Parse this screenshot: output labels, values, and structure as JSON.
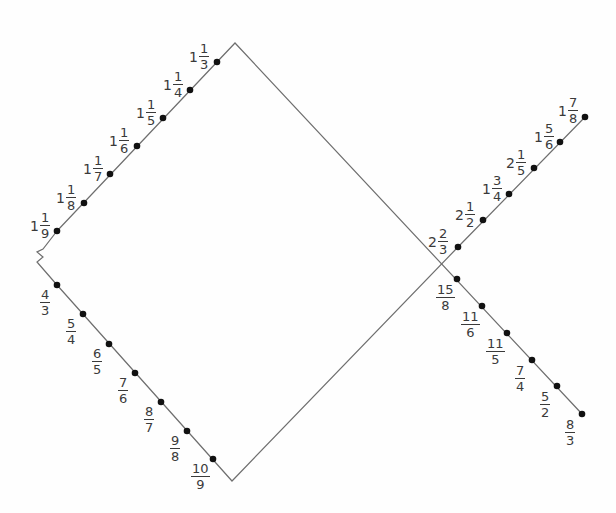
{
  "diagram": {
    "type": "dot-to-dot",
    "shape": "fish",
    "line_color": "#6e6e6e",
    "dot_color": "#111111",
    "label_color": "#3a3a3a",
    "outline_points": [
      [
        57,
        231
      ],
      [
        43,
        249
      ],
      [
        37,
        252
      ],
      [
        43,
        257
      ],
      [
        37,
        262
      ],
      [
        57,
        285
      ],
      [
        232,
        481
      ],
      [
        458,
        247
      ],
      [
        585,
        117
      ]
    ],
    "outline_points_2": [
      [
        57,
        231
      ],
      [
        235,
        43
      ],
      [
        582,
        414
      ]
    ],
    "dots": [
      {
        "id": "d1",
        "x": 217,
        "y": 62,
        "whole": "1",
        "num": "1",
        "den": "3",
        "lx": 189,
        "ly": 42
      },
      {
        "id": "d2",
        "x": 190,
        "y": 90,
        "whole": "1",
        "num": "1",
        "den": "4",
        "lx": 163,
        "ly": 70
      },
      {
        "id": "d3",
        "x": 163,
        "y": 118,
        "whole": "1",
        "num": "1",
        "den": "5",
        "lx": 136,
        "ly": 98
      },
      {
        "id": "d4",
        "x": 137,
        "y": 146,
        "whole": "1",
        "num": "1",
        "den": "6",
        "lx": 109,
        "ly": 126
      },
      {
        "id": "d5",
        "x": 110,
        "y": 174,
        "whole": "1",
        "num": "1",
        "den": "7",
        "lx": 83,
        "ly": 154
      },
      {
        "id": "d6",
        "x": 84,
        "y": 203,
        "whole": "1",
        "num": "1",
        "den": "8",
        "lx": 56,
        "ly": 183
      },
      {
        "id": "d7",
        "x": 57,
        "y": 231,
        "whole": "1",
        "num": "1",
        "den": "9",
        "lx": 30,
        "ly": 211
      },
      {
        "id": "d8",
        "x": 57,
        "y": 285,
        "whole": "",
        "num": "4",
        "den": "3",
        "lx": 40,
        "ly": 288
      },
      {
        "id": "d9",
        "x": 83,
        "y": 314,
        "whole": "",
        "num": "5",
        "den": "4",
        "lx": 66,
        "ly": 317
      },
      {
        "id": "d10",
        "x": 109,
        "y": 344,
        "whole": "",
        "num": "6",
        "den": "5",
        "lx": 92,
        "ly": 347
      },
      {
        "id": "d11",
        "x": 135,
        "y": 373,
        "whole": "",
        "num": "7",
        "den": "6",
        "lx": 118,
        "ly": 376
      },
      {
        "id": "d12",
        "x": 161,
        "y": 402,
        "whole": "",
        "num": "8",
        "den": "7",
        "lx": 144,
        "ly": 405
      },
      {
        "id": "d13",
        "x": 187,
        "y": 431,
        "whole": "",
        "num": "9",
        "den": "8",
        "lx": 170,
        "ly": 434
      },
      {
        "id": "d14",
        "x": 213,
        "y": 459,
        "whole": "",
        "num": "10",
        "den": "9",
        "lx": 191,
        "ly": 462
      },
      {
        "id": "d15",
        "x": 458,
        "y": 247,
        "whole": "2",
        "num": "2",
        "den": "3",
        "lx": 428,
        "ly": 227
      },
      {
        "id": "d16",
        "x": 483,
        "y": 220,
        "whole": "2",
        "num": "1",
        "den": "2",
        "lx": 455,
        "ly": 200
      },
      {
        "id": "d17",
        "x": 509,
        "y": 194,
        "whole": "1",
        "num": "3",
        "den": "4",
        "lx": 482,
        "ly": 174
      },
      {
        "id": "d18",
        "x": 534,
        "y": 168,
        "whole": "2",
        "num": "1",
        "den": "5",
        "lx": 506,
        "ly": 148
      },
      {
        "id": "d19",
        "x": 560,
        "y": 142,
        "whole": "1",
        "num": "5",
        "den": "6",
        "lx": 534,
        "ly": 122
      },
      {
        "id": "d20",
        "x": 585,
        "y": 117,
        "whole": "1",
        "num": "7",
        "den": "8",
        "lx": 558,
        "ly": 96
      },
      {
        "id": "d21",
        "x": 457,
        "y": 279,
        "whole": "",
        "num": "15",
        "den": "8",
        "lx": 436,
        "ly": 283
      },
      {
        "id": "d22",
        "x": 482,
        "y": 306,
        "whole": "",
        "num": "11",
        "den": "6",
        "lx": 461,
        "ly": 310
      },
      {
        "id": "d23",
        "x": 507,
        "y": 333,
        "whole": "",
        "num": "11",
        "den": "5",
        "lx": 486,
        "ly": 337
      },
      {
        "id": "d24",
        "x": 532,
        "y": 360,
        "whole": "",
        "num": "7",
        "den": "4",
        "lx": 515,
        "ly": 364
      },
      {
        "id": "d25",
        "x": 557,
        "y": 386,
        "whole": "",
        "num": "5",
        "den": "2",
        "lx": 540,
        "ly": 390
      },
      {
        "id": "d26",
        "x": 582,
        "y": 414,
        "whole": "",
        "num": "8",
        "den": "3",
        "lx": 565,
        "ly": 418
      }
    ]
  }
}
